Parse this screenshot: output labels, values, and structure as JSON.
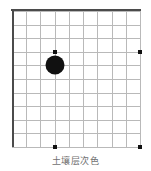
{
  "figure": {
    "caption": "土壤层次色",
    "background_color": "#ffffff"
  },
  "chart_data": {
    "type": "scatter",
    "title": "",
    "subtitle": "",
    "xlabel": "",
    "ylabel": "",
    "grid": true,
    "legend": "none",
    "grid_cols": 9,
    "grid_rows": 10,
    "xlim": [
      0,
      9
    ],
    "ylim": [
      0,
      10
    ],
    "axis_frame": {
      "left_visible": true,
      "top_visible": true,
      "right_visible": false,
      "bottom_visible": false,
      "frame_color": "#4b4b4b",
      "grid_color": "#b9b9b9"
    },
    "series": [
      {
        "name": "marker-points",
        "marker": "square",
        "color": "#111111",
        "size_px": 4,
        "points": [
          {
            "x": 3,
            "y": 7
          },
          {
            "x": 9,
            "y": 7
          },
          {
            "x": 3,
            "y": 0
          },
          {
            "x": 9,
            "y": 0
          }
        ]
      },
      {
        "name": "highlight-point",
        "marker": "circle",
        "color": "#111111",
        "size_px": 19,
        "points": [
          {
            "x": 3,
            "y": 6
          }
        ]
      }
    ]
  }
}
